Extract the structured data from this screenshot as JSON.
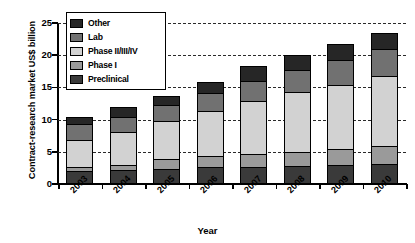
{
  "chart_data": {
    "type": "bar",
    "stacked": true,
    "title": "",
    "xlabel": "Year",
    "ylabel": "Contract-research market US$ billion",
    "categories": [
      "2003",
      "2004",
      "2005",
      "2006",
      "2007",
      "2008",
      "2009",
      "2010"
    ],
    "ylim": [
      0,
      25
    ],
    "yticks": [
      0,
      5,
      10,
      15,
      20,
      25
    ],
    "grid": "horizontal-dashed",
    "legend_position": "upper-left-inset",
    "series": [
      {
        "name": "Preclinical",
        "color": "#3a3a3a",
        "values": [
          1.9,
          2.1,
          2.3,
          2.5,
          2.6,
          2.7,
          2.8,
          3.0
        ]
      },
      {
        "name": "Phase I",
        "color": "#9a9a9a",
        "values": [
          0.6,
          0.8,
          1.5,
          1.7,
          1.9,
          2.2,
          2.5,
          2.9
        ]
      },
      {
        "name": "Phase II/III/IV",
        "color": "#d2d2d2",
        "values": [
          4.4,
          5.2,
          6.1,
          7.2,
          8.4,
          9.4,
          10.2,
          11.0
        ]
      },
      {
        "name": "Lab",
        "color": "#717171",
        "values": [
          2.5,
          2.4,
          2.5,
          2.9,
          3.2,
          3.5,
          3.8,
          4.2
        ]
      },
      {
        "name": "Other",
        "color": "#262626",
        "values": [
          1.0,
          1.5,
          1.2,
          1.6,
          2.2,
          2.2,
          2.4,
          2.4
        ]
      }
    ],
    "totals": [
      10.4,
      12.0,
      13.6,
      15.9,
      18.3,
      20.0,
      21.7,
      23.5
    ]
  },
  "legend": {
    "items": [
      {
        "label": "Other",
        "color": "#262626"
      },
      {
        "label": "Lab",
        "color": "#717171"
      },
      {
        "label": "Phase II/III/IV",
        "color": "#d2d2d2"
      },
      {
        "label": "Phase I",
        "color": "#9a9a9a"
      },
      {
        "label": "Preclinical",
        "color": "#3a3a3a"
      }
    ]
  },
  "axes": {
    "y_title": "Contract-research market US$ billion",
    "x_title": "Year"
  }
}
